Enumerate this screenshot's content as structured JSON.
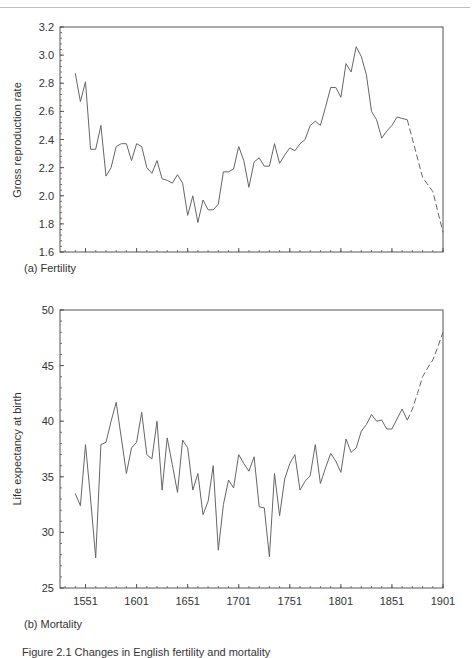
{
  "panels": [
    {
      "id": "a",
      "label": "(a) Fertility"
    },
    {
      "id": "b",
      "label": "(b) Mortality"
    }
  ],
  "caption": "Figure 2.1  Changes in English fertility and mortality",
  "chart_data": [
    {
      "type": "line",
      "title": "(a) Fertility",
      "xlabel": "",
      "ylabel": "Gross reproduction rate",
      "ylim": [
        1.6,
        3.2
      ],
      "xlim": [
        1526,
        1901
      ],
      "yticks": [
        1.6,
        1.8,
        2.0,
        2.2,
        2.4,
        2.6,
        2.8,
        3.0,
        3.2
      ],
      "ytick_labels": [
        "1.6",
        "1.8",
        "2.0",
        "2.2",
        "2.4",
        "2.6",
        "2.8",
        "3.0",
        "3.2"
      ],
      "xticks": [
        1551,
        1601,
        1651,
        1701,
        1751,
        1801,
        1851,
        1901
      ],
      "show_xtick_labels": false,
      "grid": false,
      "series": [
        {
          "name": "Gross reproduction rate (observed)",
          "style": "solid",
          "x": [
            1541,
            1546,
            1551,
            1556,
            1561,
            1566,
            1571,
            1576,
            1581,
            1586,
            1591,
            1596,
            1601,
            1606,
            1611,
            1616,
            1621,
            1626,
            1631,
            1636,
            1641,
            1646,
            1651,
            1656,
            1661,
            1666,
            1671,
            1676,
            1681,
            1686,
            1691,
            1696,
            1701,
            1706,
            1711,
            1716,
            1721,
            1726,
            1731,
            1736,
            1741,
            1746,
            1751,
            1756,
            1761,
            1766,
            1771,
            1776,
            1781,
            1786,
            1791,
            1796,
            1801,
            1806,
            1811,
            1816,
            1821,
            1826,
            1831,
            1836,
            1841,
            1846,
            1851,
            1856,
            1861,
            1866
          ],
          "values": [
            2.87,
            2.67,
            2.81,
            2.33,
            2.33,
            2.5,
            2.14,
            2.2,
            2.35,
            2.37,
            2.37,
            2.25,
            2.37,
            2.35,
            2.2,
            2.16,
            2.25,
            2.12,
            2.11,
            2.09,
            2.15,
            2.09,
            1.86,
            2.0,
            1.81,
            1.97,
            1.9,
            1.9,
            1.94,
            2.17,
            2.17,
            2.19,
            2.35,
            2.25,
            2.06,
            2.24,
            2.27,
            2.21,
            2.21,
            2.37,
            2.23,
            2.29,
            2.34,
            2.32,
            2.37,
            2.4,
            2.5,
            2.53,
            2.5,
            2.63,
            2.77,
            2.77,
            2.7,
            2.94,
            2.88,
            3.06,
            2.99,
            2.86,
            2.6,
            2.54,
            2.41,
            2.46,
            2.5,
            2.56,
            2.55,
            2.54
          ]
        },
        {
          "name": "Gross reproduction rate (later estimate)",
          "style": "dashed",
          "x": [
            1866,
            1881,
            1891,
            1901
          ],
          "values": [
            2.54,
            2.13,
            2.03,
            1.74
          ]
        }
      ]
    },
    {
      "type": "line",
      "title": "(b) Mortality",
      "xlabel": "",
      "ylabel": "Life expectancy at birth",
      "ylim": [
        25,
        50
      ],
      "xlim": [
        1526,
        1901
      ],
      "yticks": [
        25,
        30,
        35,
        40,
        45,
        50
      ],
      "ytick_labels": [
        "25",
        "30",
        "35",
        "40",
        "45",
        "50"
      ],
      "xticks": [
        1551,
        1601,
        1651,
        1701,
        1751,
        1801,
        1851,
        1901
      ],
      "xtick_labels": [
        "1551",
        "1601",
        "1651",
        "1701",
        "1751",
        "1801",
        "1851",
        "1901"
      ],
      "grid": false,
      "series": [
        {
          "name": "Life expectancy at birth (observed)",
          "style": "solid",
          "x": [
            1541,
            1546,
            1551,
            1556,
            1561,
            1566,
            1571,
            1576,
            1581,
            1586,
            1591,
            1596,
            1601,
            1606,
            1611,
            1616,
            1621,
            1626,
            1631,
            1636,
            1641,
            1646,
            1651,
            1656,
            1661,
            1666,
            1671,
            1676,
            1681,
            1686,
            1691,
            1696,
            1701,
            1706,
            1711,
            1716,
            1721,
            1726,
            1731,
            1736,
            1741,
            1746,
            1751,
            1756,
            1761,
            1766,
            1771,
            1776,
            1781,
            1786,
            1791,
            1796,
            1801,
            1806,
            1811,
            1816,
            1821,
            1826,
            1831,
            1836,
            1841,
            1846,
            1851,
            1856,
            1861,
            1866
          ],
          "values": [
            33.5,
            32.4,
            37.9,
            33.0,
            27.7,
            37.9,
            38.1,
            40.0,
            41.7,
            38.5,
            35.3,
            37.6,
            38.1,
            40.8,
            37.0,
            36.6,
            40.0,
            33.8,
            38.5,
            36.1,
            33.6,
            38.3,
            37.6,
            33.8,
            35.3,
            31.6,
            32.8,
            36.0,
            28.4,
            32.5,
            34.7,
            34.0,
            37.0,
            36.2,
            35.5,
            36.8,
            32.3,
            32.2,
            27.8,
            35.3,
            31.5,
            34.8,
            36.2,
            37.0,
            33.8,
            34.6,
            35.1,
            37.9,
            34.4,
            35.8,
            37.1,
            36.4,
            35.4,
            38.4,
            37.2,
            37.6,
            39.1,
            39.7,
            40.6,
            40.0,
            40.1,
            39.3,
            39.3,
            40.2,
            41.1,
            40.1
          ]
        },
        {
          "name": "Life expectancy at birth (later estimate)",
          "style": "dashed",
          "x": [
            1866,
            1871,
            1876,
            1881,
            1886,
            1891,
            1896,
            1901
          ],
          "values": [
            40.1,
            41.1,
            42.5,
            44.0,
            44.8,
            45.5,
            46.7,
            48.0
          ]
        }
      ]
    }
  ]
}
